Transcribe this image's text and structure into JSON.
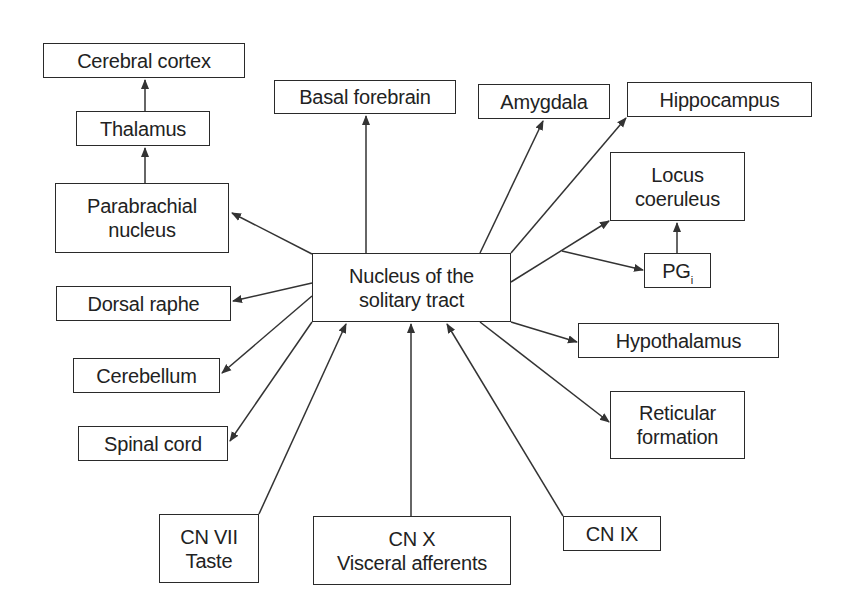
{
  "diagram": {
    "type": "flow-diagram",
    "colors": {
      "line": "#333333",
      "box_border": "#2a2a2a",
      "text": "#222222",
      "background": "#ffffff"
    },
    "nodes": {
      "nts": {
        "lines": [
          "Nucleus of the",
          "solitary tract"
        ]
      },
      "cerebral_cortex": {
        "lines": [
          "Cerebral cortex"
        ]
      },
      "thalamus": {
        "lines": [
          "Thalamus"
        ]
      },
      "parabrachial": {
        "lines": [
          "Parabrachial",
          "nucleus"
        ]
      },
      "dorsal_raphe": {
        "lines": [
          "Dorsal raphe"
        ]
      },
      "cerebellum": {
        "lines": [
          "Cerebellum"
        ]
      },
      "spinal_cord": {
        "lines": [
          "Spinal cord"
        ]
      },
      "basal_forebrain": {
        "lines": [
          "Basal forebrain"
        ]
      },
      "amygdala": {
        "lines": [
          "Amygdala"
        ]
      },
      "hippocampus": {
        "lines": [
          "Hippocampus"
        ]
      },
      "locus_coeruleus": {
        "lines": [
          "Locus",
          "coeruleus"
        ]
      },
      "pgi": {
        "main": "PG",
        "subscript": "i"
      },
      "hypothalamus": {
        "lines": [
          "Hypothalamus"
        ]
      },
      "reticular_formation": {
        "lines": [
          "Reticular",
          "formation"
        ]
      },
      "cn_vii": {
        "lines": [
          "CN VII",
          "Taste"
        ]
      },
      "cn_x": {
        "lines": [
          "CN X",
          "Visceral afferents"
        ]
      },
      "cn_ix": {
        "lines": [
          "CN IX"
        ]
      }
    },
    "edges": [
      {
        "from": "parabrachial",
        "to": "thalamus"
      },
      {
        "from": "thalamus",
        "to": "cerebral_cortex"
      },
      {
        "from": "nts",
        "to": "parabrachial"
      },
      {
        "from": "nts",
        "to": "dorsal_raphe"
      },
      {
        "from": "nts",
        "to": "cerebellum"
      },
      {
        "from": "nts",
        "to": "spinal_cord"
      },
      {
        "from": "nts",
        "to": "basal_forebrain"
      },
      {
        "from": "nts",
        "to": "amygdala"
      },
      {
        "from": "nts",
        "to": "hippocampus"
      },
      {
        "from": "nts",
        "to": "locus_coeruleus"
      },
      {
        "from": "nts",
        "to": "pgi"
      },
      {
        "from": "pgi",
        "to": "locus_coeruleus"
      },
      {
        "from": "nts",
        "to": "hypothalamus"
      },
      {
        "from": "nts",
        "to": "reticular_formation"
      },
      {
        "from": "cn_vii",
        "to": "nts"
      },
      {
        "from": "cn_x",
        "to": "nts"
      },
      {
        "from": "cn_ix",
        "to": "nts"
      }
    ]
  }
}
